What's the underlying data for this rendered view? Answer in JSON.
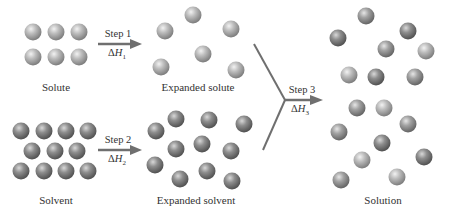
{
  "diagram": {
    "colors": {
      "solute_sphere": "#a8a8a8",
      "solvent_sphere": "#7e7e7e",
      "arrow": "#6f6f6f",
      "text": "#333333"
    },
    "stages": {
      "solute": {
        "label": "Solute"
      },
      "expanded_solute": {
        "label": "Expanded solute"
      },
      "solvent": {
        "label": "Solvent"
      },
      "expanded_solvent": {
        "label": "Expanded solvent"
      },
      "solution": {
        "label": "Solution"
      }
    },
    "steps": [
      {
        "label": "Step 1",
        "delta": "Δ",
        "h": "H",
        "sub": "1"
      },
      {
        "label": "Step 2",
        "delta": "Δ",
        "h": "H",
        "sub": "2"
      },
      {
        "label": "Step 3",
        "delta": "Δ",
        "h": "H",
        "sub": "3"
      }
    ]
  }
}
